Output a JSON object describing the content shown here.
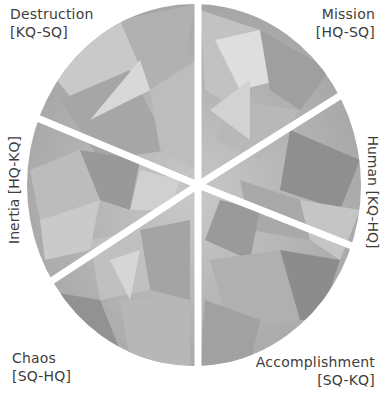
{
  "diagram": {
    "type": "segmented-ellipse",
    "segment_count": 6,
    "fill_style": "gray faceted crystal texture",
    "separator_color": "#ffffff",
    "segments": [
      {
        "id": "destruction",
        "name": "Destruction",
        "code": "[KQ-SQ]",
        "position": "top-left"
      },
      {
        "id": "mission",
        "name": "Mission",
        "code": "[HQ-SQ]",
        "position": "top-right"
      },
      {
        "id": "human",
        "name": "Human",
        "code": "[KQ-HQ]",
        "position": "right"
      },
      {
        "id": "accomplishment",
        "name": "Accomplishment",
        "code": "[SQ-KQ]",
        "position": "bottom-right"
      },
      {
        "id": "chaos",
        "name": "Chaos",
        "code": "[SQ-HQ]",
        "position": "bottom-left"
      },
      {
        "id": "inertia",
        "name": "Inertia",
        "code": "[HQ-KQ]",
        "position": "left"
      }
    ]
  },
  "labels": {
    "destruction": {
      "line1": "Destruction",
      "line2": "[KQ-SQ]"
    },
    "mission": {
      "line1": "Mission",
      "line2": "[HQ-SQ]"
    },
    "inertia": {
      "text": "Inertia [HQ-KQ]"
    },
    "human": {
      "text": "Human [KQ-HQ]"
    },
    "chaos": {
      "line1": "Chaos",
      "line2": "[SQ-HQ]"
    },
    "accomplishment": {
      "line1": "Accomplishment",
      "line2": "[SQ-KQ]"
    }
  },
  "colors": {
    "background": "#ffffff",
    "text": "#3d3d3d",
    "facet_light": "#d6d6d6",
    "facet_mid": "#b4b4b4",
    "facet_dark": "#8e8e8e"
  }
}
